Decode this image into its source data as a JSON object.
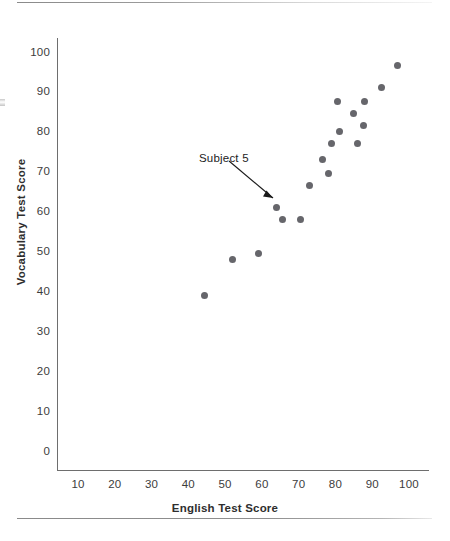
{
  "chart_data": {
    "type": "scatter",
    "title": "",
    "xlabel": "English Test Score",
    "ylabel": "Vocabulary Test Score",
    "xlim": [
      5,
      105
    ],
    "ylim": [
      0,
      105
    ],
    "xticks": [
      10,
      20,
      30,
      40,
      50,
      60,
      70,
      80,
      90,
      100
    ],
    "yticks": [
      0,
      10,
      20,
      30,
      40,
      50,
      60,
      70,
      80,
      90,
      100
    ],
    "xtick_labels": [
      "10",
      "20",
      "30",
      "40",
      "50",
      "60",
      "70",
      "80",
      "90",
      "100"
    ],
    "ytick_labels": [
      "0",
      "10",
      "20",
      "30",
      "40",
      "50",
      "60",
      "70",
      "80",
      "90",
      "100"
    ],
    "grid": false,
    "legend": null,
    "marker_color": "#66666b",
    "axis_color": "#6e6e6e",
    "series": [
      {
        "name": "Subjects",
        "points": [
          {
            "x": 44.5,
            "y": 39
          },
          {
            "x": 52.0,
            "y": 48
          },
          {
            "x": 59.0,
            "y": 49.5
          },
          {
            "x": 64.0,
            "y": 61
          },
          {
            "x": 65.5,
            "y": 58
          },
          {
            "x": 70.5,
            "y": 58
          },
          {
            "x": 73.0,
            "y": 66.5
          },
          {
            "x": 76.5,
            "y": 73
          },
          {
            "x": 78.0,
            "y": 69.5
          },
          {
            "x": 79.0,
            "y": 77
          },
          {
            "x": 80.5,
            "y": 87.5
          },
          {
            "x": 81.0,
            "y": 80
          },
          {
            "x": 85.0,
            "y": 84.5
          },
          {
            "x": 86.0,
            "y": 77
          },
          {
            "x": 87.5,
            "y": 81.5
          },
          {
            "x": 88.0,
            "y": 87.5
          },
          {
            "x": 92.5,
            "y": 91
          },
          {
            "x": 97.0,
            "y": 96.5
          }
        ]
      }
    ],
    "annotations": [
      {
        "text": "Subject 5",
        "target": {
          "x": 64.0,
          "y": 61
        },
        "arrow": true
      }
    ]
  }
}
